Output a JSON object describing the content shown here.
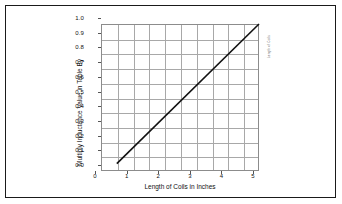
{
  "chart_data": {
    "type": "line",
    "title": "",
    "xlabel": "Length of Coils in Inches",
    "ylabel": "Multiply Inductance Value in Table By",
    "xlim": [
      0,
      5
    ],
    "ylim": [
      0,
      1.0
    ],
    "xticks": [
      "0",
      "1",
      "2",
      "3",
      "4",
      "5"
    ],
    "xtick_values": [
      0,
      1,
      2,
      3,
      4,
      5
    ],
    "yticks": [
      "0.0",
      "0.1",
      "0.2",
      "0.3",
      "0.4",
      "0.5",
      "0.6",
      "0.7",
      "0.8",
      "0.9",
      "1.0"
    ],
    "ytick_values": [
      0.0,
      0.1,
      0.2,
      0.3,
      0.4,
      0.5,
      0.6,
      0.7,
      0.8,
      0.9,
      1.0
    ],
    "grid": true,
    "grid_minor_x": [
      0.5,
      1.5,
      2.5,
      3.5,
      4.5
    ],
    "legend": null,
    "series": [
      {
        "name": "Inductance multiplier",
        "x": [
          0.5,
          5.0
        ],
        "values": [
          0.05,
          1.0
        ],
        "color": "#111111"
      }
    ],
    "annotations": [
      {
        "name": "side-note",
        "text": "Length of Coils",
        "rotation": -90,
        "position": "right-edge-top"
      }
    ],
    "colors": {
      "line": "#111111",
      "grid": "#a8a8a8",
      "axis": "#8c8c8c",
      "text": "#111111",
      "border": "#1a1a1a",
      "background": "#ffffff"
    }
  }
}
